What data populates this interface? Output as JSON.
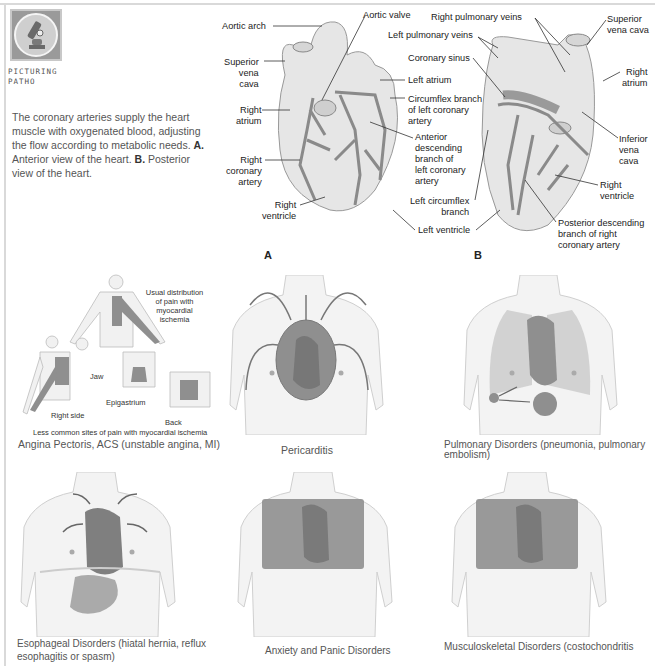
{
  "header": {
    "logo_icon": "microscope-icon",
    "logo_label_line1": "PICTURING",
    "logo_label_line2": "PATHO"
  },
  "intro": {
    "text_main": "The coronary arteries supply the heart muscle with oxygenated blood, adjusting the flow according to metabolic needs.",
    "label_a": "A.",
    "text_a": " Anterior view of the heart. ",
    "label_b": "B.",
    "text_b": " Posterior view of the heart."
  },
  "heart_anterior": {
    "panel_letter": "A",
    "labels": {
      "aortic_arch": "Aortic arch",
      "aortic_valve": "Aortic valve",
      "superior_vena_cava": [
        "Superior",
        "vena",
        "cava"
      ],
      "right_atrium": [
        "Right",
        "atrium"
      ],
      "right_coronary_artery": [
        "Right",
        "coronary",
        "artery"
      ],
      "right_ventricle": [
        "Right",
        "ventricle"
      ],
      "left_pulmonary_veins": "Left pulmonary veins",
      "coronary_sinus": "Coronary sinus",
      "left_atrium": "Left atrium",
      "circumflex_branch": [
        "Circumflex branch",
        "of left coronary",
        "artery"
      ],
      "anterior_descending": [
        "Anterior",
        "descending",
        "branch of",
        "left coronary",
        "artery"
      ],
      "left_circumflex_branch": [
        "Left circumflex",
        "branch"
      ],
      "left_ventricle": "Left ventricle"
    }
  },
  "heart_posterior": {
    "panel_letter": "B",
    "labels": {
      "right_pulmonary_veins": "Right pulmonary veins",
      "superior_vena_cava": [
        "Superior",
        "vena cava"
      ],
      "right_atrium": [
        "Right",
        "atrium"
      ],
      "inferior_vena_cava": [
        "Inferior",
        "vena",
        "cava"
      ],
      "right_ventricle": [
        "Right",
        "ventricle"
      ],
      "posterior_descending": [
        "Posterior descending",
        "branch of right",
        "coronary artery"
      ]
    }
  },
  "pain_figures": [
    {
      "id": "angina",
      "caption": "Angina Pectoris, ACS (unstable angina, MI)",
      "sub_labels": {
        "usual": [
          "Usual distribution",
          "of pain with",
          "myocardial",
          "ischemia"
        ],
        "jaw": "Jaw",
        "right_side": "Right side",
        "epigastrium": "Epigastrium",
        "back": "Back",
        "less_common": "Less common sites of pain with myocardial ischemia"
      }
    },
    {
      "id": "pericarditis",
      "caption": "Pericarditis"
    },
    {
      "id": "pulmonary",
      "caption_line1": "Pulmonary Disorders (pneumonia, pulmonary",
      "caption_line2": "embolism)"
    },
    {
      "id": "esophageal",
      "caption_line1": "Esophageal Disorders (hiatal hernia, reflux",
      "caption_line2": "esophagitis or spasm)"
    },
    {
      "id": "anxiety",
      "caption": "Anxiety and Panic Disorders"
    },
    {
      "id": "musculoskeletal",
      "caption": "Musculoskeletal Disorders (costochondritis"
    }
  ],
  "colors": {
    "heart_fill": "#e6e6e6",
    "vessel": "#8a8a8a",
    "pain_region": "#8f8f8f",
    "torso": "#f3f3f3",
    "text": "#555555"
  }
}
